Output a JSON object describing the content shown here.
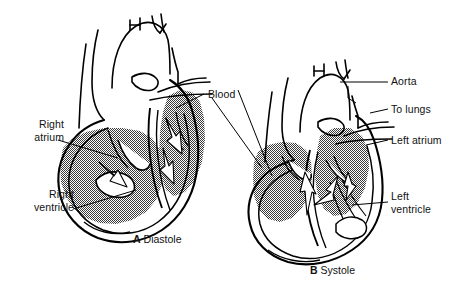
{
  "figure": {
    "title_alt": "Heart during diastole and systole",
    "background_color": "#ffffff",
    "line_color": "#000000",
    "blood_fill_color": "#8a8a8a",
    "muscle_fill_color": "#ffffff"
  },
  "panels": [
    {
      "id": "diastole",
      "letter": "A",
      "name": "Diastole",
      "caption": "A  Diastole"
    },
    {
      "id": "systole",
      "letter": "B",
      "name": "Systole",
      "caption": "B  Systole"
    }
  ],
  "labels": {
    "right_atrium": "Right\natrium",
    "right_atrium_line1": "Right",
    "right_atrium_line2": "atrium",
    "right_ventricle_line1": "Right",
    "right_ventricle_line2": "ventricle",
    "blood": "Blood",
    "aorta": "Aorta",
    "to_lungs": "To lungs",
    "left_atrium": "Left atrium",
    "left_ventricle_line1": "Left",
    "left_ventricle_line2": "ventricle"
  },
  "captions": {
    "a_letter": "A",
    "a_text": "Diastole",
    "b_letter": "B",
    "b_text": "Systole"
  }
}
